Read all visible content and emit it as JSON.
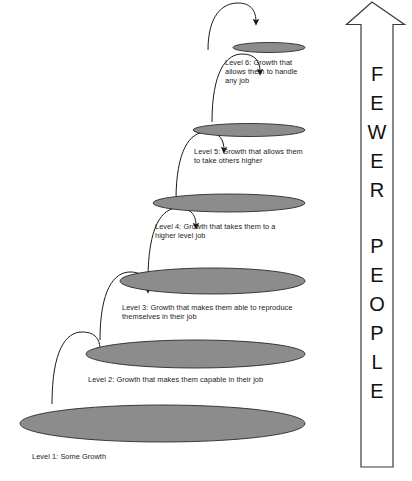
{
  "diagram": {
    "type": "pyramid-levels-with-progression-arrows",
    "background_color": "#ffffff",
    "ellipse_fill": "#8c8c8c",
    "ellipse_stroke": "#2b2b2b",
    "text_color": "#1b1b1b",
    "levels": [
      {
        "id": "level-6",
        "label": "Level 6: Growth that\nallows them to handle\nany job",
        "ellipse": {
          "cx": 269,
          "cy": 47.5,
          "rx": 36,
          "ry": 5
        },
        "label_pos": {
          "x": 225,
          "y": 58
        }
      },
      {
        "id": "level-5",
        "label": "Level 5: Growth that allows them\nto take others higher",
        "ellipse": {
          "cx": 249,
          "cy": 130,
          "rx": 56,
          "ry": 6.5
        },
        "label_pos": {
          "x": 194,
          "y": 147
        }
      },
      {
        "id": "level-4",
        "label": "Level 4: Growth that takes them to a\nhigher level job",
        "ellipse": {
          "cx": 229,
          "cy": 203,
          "rx": 76,
          "ry": 9
        },
        "label_pos": {
          "x": 155,
          "y": 222
        }
      },
      {
        "id": "level-3",
        "label": "Level 3: Growth that makes them able to reproduce\nthemselves in their job",
        "ellipse": {
          "cx": 212.5,
          "cy": 281,
          "rx": 92.5,
          "ry": 13
        },
        "label_pos": {
          "x": 122,
          "y": 303
        }
      },
      {
        "id": "level-2",
        "label": "Level 2: Growth that makes them capable in their job",
        "ellipse": {
          "cx": 195.5,
          "cy": 354,
          "rx": 109.5,
          "ry": 14
        },
        "label_pos": {
          "x": 88,
          "y": 375
        }
      },
      {
        "id": "level-1",
        "label": "Level 1: Some Growth",
        "ellipse": {
          "cx": 162.5,
          "cy": 423.5,
          "rx": 142.5,
          "ry": 18.5
        },
        "label_pos": {
          "x": 32,
          "y": 452
        }
      }
    ],
    "progression_arrows": [
      {
        "id": "arrow-level1-to-level2",
        "from_level": "level-1",
        "to_level": "level-2",
        "path": "M 52 404 C 52 350, 66 332, 82 332 C 96 332, 100 340, 100 350"
      },
      {
        "id": "arrow-level2-to-level3",
        "from_level": "level-2",
        "to_level": "level-3",
        "path": "M 100 340 C 100 290, 114 272, 130 272 C 144 272, 148 280, 148 290"
      },
      {
        "id": "arrow-level3-to-level4",
        "from_level": "level-3",
        "to_level": "level-4",
        "path": "M 148 280 C 148 226, 162 208, 178 208 C 192 208, 196 216, 196 226"
      },
      {
        "id": "arrow-level4-to-level5",
        "from_level": "level-4",
        "to_level": "level-5",
        "path": "M 176 200 C 176 150, 190 132, 206 132 C 220 132, 224 140, 224 150"
      },
      {
        "id": "arrow-level5-to-level6",
        "from_level": "level-5",
        "to_level": "level-6",
        "path": "M 212 122 C 212 72, 226 54, 242 54 C 256 54, 260 62, 260 72"
      },
      {
        "id": "arrow-level6-top",
        "from_level": "level-6",
        "to_level": "level-6",
        "path": "M 208 50 C 208 16, 222 3, 238 3 C 252 3, 256 12, 256 22"
      }
    ]
  },
  "side_arrow": {
    "id": "fewer-people-arrow",
    "direction": "up",
    "fill": "#ffffff",
    "stroke": "#3a3a3a",
    "words": [
      "FEWER",
      "PEOPLE"
    ],
    "letters_fewer": [
      "F",
      "E",
      "W",
      "E",
      "R"
    ],
    "letters_people": [
      "P",
      "E",
      "O",
      "P",
      "L",
      "E"
    ],
    "text_full": "FEWER PEOPLE"
  }
}
